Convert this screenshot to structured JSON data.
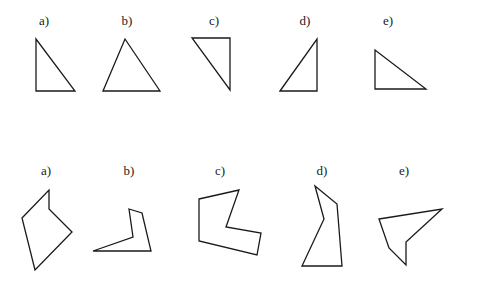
{
  "rows": [
    {
      "name": "triangles",
      "figures": [
        {
          "label": "a)",
          "kind": "right triangle, right angle bottom-left"
        },
        {
          "label": "b)",
          "kind": "acute triangle"
        },
        {
          "label": "c)",
          "kind": "right triangle, right angle top-right"
        },
        {
          "label": "d)",
          "kind": "right triangle, right angle bottom-right"
        },
        {
          "label": "e)",
          "kind": "right triangle, right angle bottom-left"
        }
      ]
    },
    {
      "name": "polygons",
      "figures": [
        {
          "label": "a)",
          "kind": "pentagon"
        },
        {
          "label": "b)",
          "kind": "pentagon"
        },
        {
          "label": "c)",
          "kind": "hexagon"
        },
        {
          "label": "d)",
          "kind": "pentagon"
        },
        {
          "label": "e)",
          "kind": "pentagon"
        }
      ]
    }
  ]
}
